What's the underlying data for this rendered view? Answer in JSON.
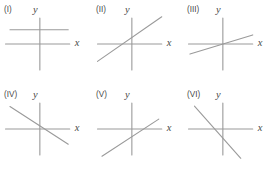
{
  "figure": {
    "background_color": "#ffffff",
    "line_color": "#9a9a9a",
    "text_color": "#4a4a4a",
    "columns": 3,
    "rows": 2,
    "panel_count": 6
  },
  "axis_labels": {
    "x": "x",
    "y": "y"
  },
  "chart_data": {
    "type": "line",
    "title": "",
    "xlabel": "x",
    "ylabel": "y",
    "grid": false,
    "legend": "none",
    "panels": [
      {
        "label": "(I)",
        "slope": 0,
        "intercept": 0.55,
        "relation_to_x_axis": "parallel, above",
        "x_range": [
          -1.0,
          0.95
        ],
        "line_points": [
          [
            -1.0,
            0.55
          ],
          [
            0.95,
            0.55
          ]
        ],
        "axis_x_points": [
          [
            -1.15,
            0
          ],
          [
            1.0,
            0
          ]
        ],
        "axis_y_points": [
          [
            0,
            1.0
          ],
          [
            0,
            -1.0
          ]
        ]
      },
      {
        "label": "(II)",
        "slope": 0.8,
        "intercept": 0.25,
        "relation_to_x_axis": "crosses left of origin",
        "x_range": [
          -1.15,
          1.0
        ],
        "line_points": [
          [
            -1.15,
            -0.67
          ],
          [
            1.0,
            1.05
          ]
        ],
        "axis_x_points": [
          [
            -1.15,
            0
          ],
          [
            1.0,
            0
          ]
        ],
        "axis_y_points": [
          [
            0,
            1.0
          ],
          [
            0,
            -1.0
          ]
        ]
      },
      {
        "label": "(III)",
        "slope": 0.35,
        "intercept": 0.0,
        "relation_to_x_axis": "passes through origin",
        "x_range": [
          -1.1,
          1.0
        ],
        "line_points": [
          [
            -1.1,
            -0.39
          ],
          [
            1.0,
            0.35
          ]
        ],
        "axis_x_points": [
          [
            -1.15,
            0
          ],
          [
            1.0,
            0
          ]
        ],
        "axis_y_points": [
          [
            0,
            1.0
          ],
          [
            0,
            -1.0
          ]
        ]
      },
      {
        "label": "(IV)",
        "slope": -0.75,
        "intercept": 0.12,
        "relation_to_x_axis": "crosses right of origin",
        "x_range": [
          -1.0,
          0.95
        ],
        "line_points": [
          [
            -1.0,
            0.87
          ],
          [
            0.95,
            -0.59
          ]
        ],
        "axis_x_points": [
          [
            -1.15,
            0
          ],
          [
            1.0,
            0
          ]
        ],
        "axis_y_points": [
          [
            0,
            1.0
          ],
          [
            0,
            -1.0
          ]
        ]
      },
      {
        "label": "(V)",
        "slope": 0.75,
        "intercept": -0.3,
        "relation_to_x_axis": "crosses right of origin",
        "x_range": [
          -1.0,
          0.9
        ],
        "line_points": [
          [
            -1.0,
            -1.05
          ],
          [
            0.9,
            0.38
          ]
        ],
        "axis_x_points": [
          [
            -1.15,
            0
          ],
          [
            1.0,
            0
          ]
        ],
        "axis_y_points": [
          [
            0,
            1.0
          ],
          [
            0,
            -1.0
          ]
        ]
      },
      {
        "label": "(VI)",
        "slope": -1.3,
        "intercept": -0.35,
        "relation_to_x_axis": "crosses left of origin",
        "x_range": [
          -0.95,
          0.6
        ],
        "line_points": [
          [
            -0.95,
            0.88
          ],
          [
            0.6,
            -1.13
          ]
        ],
        "axis_x_points": [
          [
            -1.15,
            0
          ],
          [
            1.0,
            0
          ]
        ],
        "axis_y_points": [
          [
            0,
            1.0
          ],
          [
            0,
            -1.0
          ]
        ]
      }
    ]
  }
}
